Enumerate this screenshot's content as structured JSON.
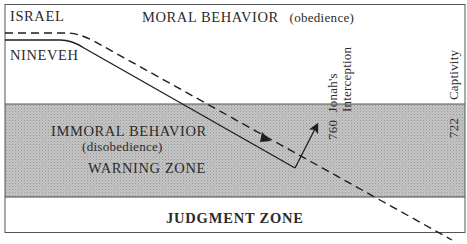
{
  "diagram": {
    "colors": {
      "warning_zone": "#bdbdbd",
      "frame": "#555555",
      "line": "#1e1e1e",
      "background": "#ffffff"
    },
    "zones": {
      "moral": {
        "title": "MORAL BEHAVIOR",
        "subtitle": "(obedience)"
      },
      "immoral": {
        "title": "IMMORAL BEHAVIOR",
        "subtitle": "(disobedience)",
        "zone_label": "WARNING ZONE"
      },
      "judgment": {
        "title": "JUDGMENT ZONE"
      }
    },
    "nations": [
      {
        "name": "ISRAEL",
        "line_style": "dashed"
      },
      {
        "name": "NINEVEH",
        "line_style": "solid"
      }
    ],
    "events": [
      {
        "year": "760",
        "label_line1": "Jonah's",
        "label_line2": "Interception"
      },
      {
        "year": "722",
        "label": "Captivity"
      }
    ]
  }
}
